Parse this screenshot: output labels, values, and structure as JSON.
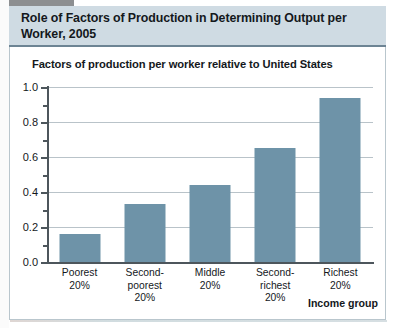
{
  "figure": {
    "title": "Role of Factors of Production in Determining Output per Worker, 2005",
    "axis_caption": "Factors of production per worker relative to United States",
    "axis_title": "Income group",
    "band_color": "#cfdbe3",
    "bar_color": "#6e93a8",
    "grid_color": "#b9c3c9"
  },
  "chart_data": {
    "type": "bar",
    "title": "Role of Factors of Production in Determining Output per Worker, 2005",
    "subtitle": "Factors of production per worker relative to United States",
    "xlabel": "Income group",
    "ylabel": "Factors of production per worker relative to United States",
    "categories": [
      "Poorest 20%",
      "Second-poorest 20%",
      "Middle 20%",
      "Second-richest 20%",
      "Richest 20%"
    ],
    "category_lines": [
      [
        "Poorest",
        "20%"
      ],
      [
        "Second-poorest",
        "20%"
      ],
      [
        "Middle",
        "20%"
      ],
      [
        "Second-richest",
        "20%"
      ],
      [
        "Richest",
        "20%"
      ]
    ],
    "values": [
      0.16,
      0.33,
      0.44,
      0.65,
      0.94
    ],
    "ylim": [
      0.0,
      1.0
    ],
    "yticks": [
      "0.0",
      "0.2",
      "0.4",
      "0.6",
      "0.8",
      "1.0"
    ],
    "ytick_values": [
      0.0,
      0.2,
      0.4,
      0.6,
      0.8,
      1.0
    ],
    "yminor_ticks": [
      0.1,
      0.3,
      0.5,
      0.7,
      0.9
    ],
    "grid": true,
    "legend": false
  }
}
